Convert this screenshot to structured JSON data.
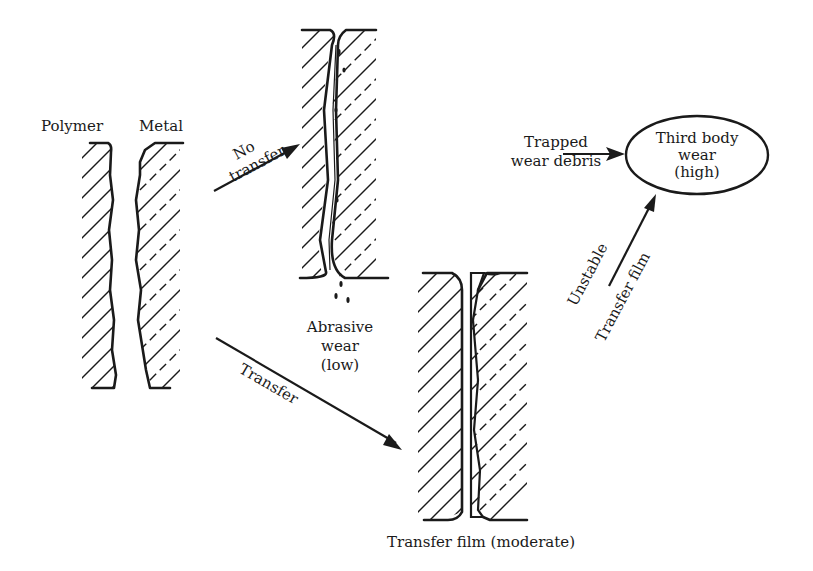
{
  "diagram": {
    "initial_state": {
      "labels": {
        "polymer": "Polymer",
        "metal": "Metal"
      }
    },
    "transitions": [
      {
        "id": "no-transfer",
        "label_line1": "No",
        "label_line2": "transfer",
        "from": "initial_state",
        "to": "abrasive_wear"
      },
      {
        "id": "transfer",
        "label": "Transfer",
        "from": "initial_state",
        "to": "transfer_film"
      },
      {
        "id": "unstable-transfer-film",
        "label_line1": "Unstable",
        "label_line2": "Transfer film",
        "from": "transfer_film",
        "to": "third_body_wear"
      },
      {
        "id": "trapped-debris",
        "label_line1": "Trapped",
        "label_line2": "wear debris",
        "from": "trapped_wear_debris",
        "to": "third_body_wear"
      }
    ],
    "abrasive_wear": {
      "line1": "Abrasive",
      "line2": "wear",
      "line3": "(low)"
    },
    "transfer_film": {
      "label": "Transfer film (moderate)"
    },
    "third_body_wear": {
      "line1": "Third body",
      "line2": "wear",
      "line3": "(high)"
    },
    "colors": {
      "ink": "#1a1a1a",
      "background": "#ffffff"
    }
  }
}
